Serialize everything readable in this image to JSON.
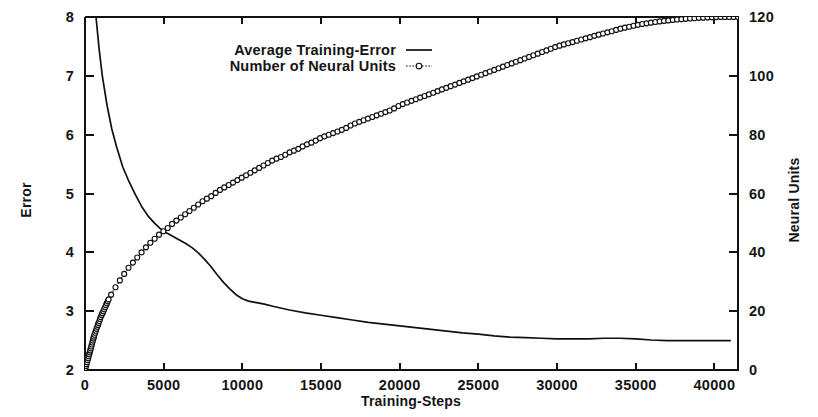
{
  "chart_data": {
    "type": "line",
    "title": "",
    "xlabel": "Training-Steps",
    "ylabel": "Error",
    "y2label": "Neural Units",
    "xlim": [
      0,
      41500
    ],
    "ylim": [
      2,
      8
    ],
    "y2lim": [
      0,
      120
    ],
    "grid": false,
    "legend_position": "top-center-inside",
    "xticks": [
      0,
      5000,
      10000,
      15000,
      20000,
      25000,
      30000,
      35000,
      40000
    ],
    "xticklabels": [
      "0",
      "5000",
      "10000",
      "15000",
      "20000",
      "25000",
      "30000",
      "35000",
      "40000"
    ],
    "yticks": [
      2,
      3,
      4,
      5,
      6,
      7,
      8
    ],
    "yticklabels": [
      "2",
      "3",
      "4",
      "5",
      "6",
      "7",
      "8"
    ],
    "y2ticks": [
      0,
      20,
      40,
      60,
      80,
      100,
      120
    ],
    "y2ticklabels": [
      "0",
      "20",
      "40",
      "60",
      "80",
      "100",
      "120"
    ],
    "series": [
      {
        "name": "Average Training-Error",
        "axis": "left",
        "style": "solid-line",
        "marker": "none",
        "x": [
          0,
          200,
          400,
          600,
          700,
          900,
          1100,
          1400,
          1700,
          2000,
          2400,
          2800,
          3200,
          3600,
          4000,
          4400,
          4800,
          5200,
          5600,
          6000,
          6400,
          6800,
          7200,
          7600,
          8000,
          8400,
          8800,
          9200,
          9600,
          10000,
          10400,
          10800,
          11000,
          11400,
          12000,
          13000,
          14000,
          15000,
          16000,
          17000,
          18000,
          19000,
          20000,
          21000,
          22000,
          23000,
          24000,
          25000,
          26000,
          27000,
          28000,
          29000,
          30000,
          31000,
          32000,
          33000,
          34000,
          35000,
          36000,
          37000,
          38000,
          39000,
          40000,
          41000
        ],
        "y": [
          10.2,
          9.6,
          8.95,
          8.35,
          8.0,
          7.45,
          7.0,
          6.5,
          6.1,
          5.8,
          5.45,
          5.2,
          4.98,
          4.78,
          4.62,
          4.5,
          4.4,
          4.33,
          4.27,
          4.21,
          4.15,
          4.08,
          3.99,
          3.88,
          3.76,
          3.62,
          3.49,
          3.38,
          3.28,
          3.21,
          3.17,
          3.15,
          3.14,
          3.12,
          3.08,
          3.02,
          2.97,
          2.93,
          2.89,
          2.85,
          2.81,
          2.78,
          2.75,
          2.72,
          2.69,
          2.66,
          2.63,
          2.61,
          2.58,
          2.56,
          2.55,
          2.54,
          2.53,
          2.53,
          2.53,
          2.54,
          2.54,
          2.53,
          2.51,
          2.5,
          2.5,
          2.5,
          2.5,
          2.5
        ]
      },
      {
        "name": "Number of Neural Units",
        "axis": "right",
        "style": "dotted-line",
        "marker": "open-circle",
        "x": [
          0,
          150,
          300,
          450,
          600,
          800,
          1000,
          1250,
          1500,
          1800,
          2100,
          2400,
          2800,
          3200,
          3600,
          4000,
          4400,
          4800,
          5200,
          5600,
          6000,
          6500,
          7000,
          7500,
          8000,
          8500,
          9000,
          9500,
          10000,
          10500,
          11000,
          11500,
          12000,
          12500,
          13000,
          13500,
          14000,
          14500,
          15000,
          15500,
          16000,
          16500,
          17000,
          17500,
          18000,
          18500,
          19000,
          19500,
          20000,
          20500,
          21000,
          21500,
          22000,
          22500,
          23000,
          23500,
          24000,
          24500,
          25000,
          25500,
          26000,
          26500,
          27000,
          27500,
          28000,
          28500,
          29000,
          29500,
          30000,
          30500,
          31000,
          31500,
          32000,
          32500,
          33000,
          33500,
          34000,
          34500,
          35000,
          35500,
          36000,
          36500,
          37000,
          37500,
          38000,
          38500,
          39000,
          39500,
          40000,
          40500,
          41000
        ],
        "y": [
          0,
          3,
          6,
          9,
          12,
          15,
          18,
          21,
          24,
          27,
          29.5,
          32,
          35,
          37.5,
          40,
          42.5,
          44.5,
          46.5,
          48,
          50,
          51.5,
          53.5,
          55.5,
          57.5,
          59,
          61,
          62.5,
          64,
          65.5,
          67,
          68.5,
          70,
          71.5,
          72.5,
          74,
          75,
          76.5,
          77.5,
          79,
          80,
          81,
          82,
          83.5,
          84.5,
          85.5,
          86.5,
          87.5,
          88.5,
          90,
          91,
          92,
          93,
          94,
          95,
          96,
          97,
          98,
          99,
          100,
          101,
          102,
          103,
          104,
          105,
          106,
          107,
          108,
          109,
          110,
          110.8,
          111.5,
          112.3,
          113,
          113.8,
          114.5,
          115.2,
          116,
          116.6,
          117.2,
          117.7,
          118.1,
          118.5,
          118.8,
          119.1,
          119.3,
          119.5,
          119.7,
          119.85,
          119.95,
          120,
          120
        ]
      }
    ],
    "legend_entries": [
      {
        "label": "Average Training-Error",
        "style": "solid-line",
        "marker": "none"
      },
      {
        "label": "Number of Neural Units",
        "style": "dotted-line",
        "marker": "open-circle"
      }
    ],
    "colors": {
      "foreground": "#101010",
      "background": "#ffffff"
    }
  }
}
